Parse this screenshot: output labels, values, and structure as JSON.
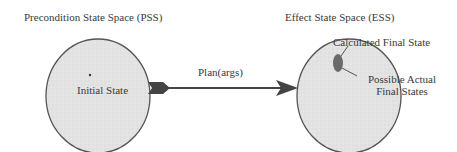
{
  "diagram": {
    "pss": {
      "title": "Precondition State Space (PSS)",
      "point_label": "Initial State"
    },
    "ess": {
      "title": "Effect State Space (ESS)",
      "calc_label": "Calculated Final State",
      "possible_label_1": "Possible Actual",
      "possible_label_2": "Final States"
    },
    "arrow": {
      "label": "Plan(args)"
    },
    "colors": {
      "region_fill": "#e2e2e2",
      "outline": "#555555",
      "arrow": "#444444",
      "blob": "#6a6a6a"
    }
  }
}
